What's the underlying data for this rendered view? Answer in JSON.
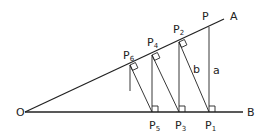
{
  "diagram": {
    "title": "",
    "stroke_color": "#222222",
    "points": {
      "O": {
        "label": "O",
        "x": 25,
        "y": 112
      },
      "A": {
        "label": "A",
        "x": 224,
        "y": 19
      },
      "B": {
        "label": "B",
        "x": 243,
        "y": 112
      },
      "P": {
        "label": "P",
        "x": 209,
        "y": 27
      },
      "P1": {
        "label": "P",
        "sub": "1",
        "x": 209,
        "y": 112
      },
      "P2": {
        "label": "P",
        "sub": "2",
        "x": 179,
        "y": 42
      },
      "P3": {
        "label": "P",
        "sub": "3",
        "x": 179,
        "y": 112
      },
      "P4": {
        "label": "P",
        "sub": "4",
        "x": 152,
        "y": 55
      },
      "P5": {
        "label": "P",
        "sub": "5",
        "x": 152,
        "y": 112
      },
      "P6": {
        "label": "P",
        "sub": "6",
        "x": 130,
        "y": 65
      }
    },
    "segment_labels": {
      "a": "a",
      "b": "b"
    },
    "labels": {
      "O": "O",
      "A": "A",
      "B": "B",
      "P": "P",
      "P1": "P",
      "P1_sub": "1",
      "P2": "P",
      "P2_sub": "2",
      "P3": "P",
      "P3_sub": "3",
      "P4": "P",
      "P4_sub": "4",
      "P5": "P",
      "P5_sub": "5",
      "P6": "P",
      "P6_sub": "6"
    }
  }
}
